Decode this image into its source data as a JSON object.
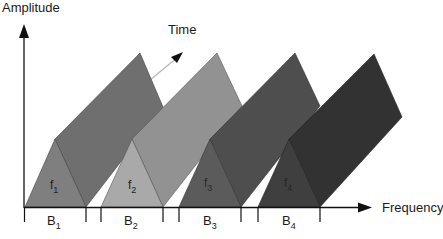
{
  "diagram": {
    "type": "frequency-time multiplexing diagram",
    "y_axis_label": "Amplitude",
    "x_axis_label": "Frequency",
    "time_axis_label": "Time",
    "channels": [
      {
        "freq": "f",
        "freq_sub": "1",
        "band": "B",
        "band_sub": "1",
        "front_color": "#7f7f7f",
        "back_color": "#6f6f6f",
        "left": 25
      },
      {
        "freq": "f",
        "freq_sub": "2",
        "band": "B",
        "band_sub": "2",
        "front_color": "#a9a9a9",
        "back_color": "#929292",
        "left": 101
      },
      {
        "freq": "f",
        "freq_sub": "3",
        "band": "B",
        "band_sub": "3",
        "front_color": "#5b5b5b",
        "back_color": "#4e4e4e",
        "left": 179
      },
      {
        "freq": "f",
        "freq_sub": "4",
        "band": "B",
        "band_sub": "4",
        "front_color": "#3f3f3f",
        "back_color": "#323232",
        "left": 258
      }
    ]
  }
}
